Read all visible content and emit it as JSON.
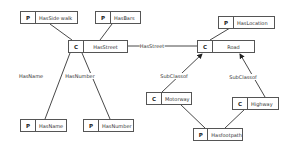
{
  "nodes": [
    {
      "id": "hassidewalk",
      "type": "P",
      "label": "HasSide walk",
      "x": 20,
      "y": 11,
      "w": 58
    },
    {
      "id": "hasbars",
      "type": "P",
      "label": "HasBars",
      "x": 95,
      "y": 11,
      "w": 46
    },
    {
      "id": "hasstreet",
      "type": "C",
      "label": "HasStreet",
      "x": 68,
      "y": 40,
      "w": 60,
      "center": true
    },
    {
      "id": "road",
      "type": "C",
      "label": "Road",
      "x": 197,
      "y": 40,
      "w": 58,
      "center": true
    },
    {
      "id": "haslocation",
      "type": "P",
      "label": "HasLocation",
      "x": 218,
      "y": 16,
      "w": 57
    },
    {
      "id": "hasname",
      "type": "P",
      "label": "HasName",
      "x": 20,
      "y": 119,
      "w": 47
    },
    {
      "id": "hasnumber",
      "type": "P",
      "label": "HasNumber",
      "x": 83,
      "y": 119,
      "w": 51
    },
    {
      "id": "motorway",
      "type": "C",
      "label": "Motorway",
      "x": 146,
      "y": 92,
      "w": 46
    },
    {
      "id": "highway",
      "type": "C",
      "label": "Highway",
      "x": 232,
      "y": 97,
      "w": 47
    },
    {
      "id": "hasfootpath",
      "type": "P",
      "label": "Hasfootpath",
      "x": 193,
      "y": 128,
      "w": 50
    }
  ],
  "edges": [
    {
      "x1": 50,
      "y1": 24,
      "x2": 72,
      "y2": 40
    },
    {
      "x1": 112,
      "y1": 24,
      "x2": 100,
      "y2": 40
    },
    {
      "x1": 128,
      "y1": 46,
      "x2": 197,
      "y2": 46
    },
    {
      "x1": 230,
      "y1": 28,
      "x2": 210,
      "y2": 40
    },
    {
      "x1": 70,
      "y1": 53,
      "x2": 45,
      "y2": 119
    },
    {
      "x1": 82,
      "y1": 53,
      "x2": 110,
      "y2": 119
    },
    {
      "x1": 162,
      "y1": 92,
      "x2": 202,
      "y2": 54,
      "arrow": true
    },
    {
      "x1": 265,
      "y1": 97,
      "x2": 240,
      "y2": 54,
      "arrow": true
    },
    {
      "x1": 180,
      "y1": 104,
      "x2": 205,
      "y2": 128
    },
    {
      "x1": 245,
      "y1": 109,
      "x2": 225,
      "y2": 128
    }
  ],
  "edge_labels": [
    {
      "text": "HasStreet",
      "x": 152,
      "y": 43
    },
    {
      "text": "HasName",
      "x": 31,
      "y": 73
    },
    {
      "text": "HasNumber",
      "x": 80,
      "y": 73
    },
    {
      "text": "SubClassof",
      "x": 174,
      "y": 73
    },
    {
      "text": "SubClassof",
      "x": 243,
      "y": 74
    }
  ]
}
